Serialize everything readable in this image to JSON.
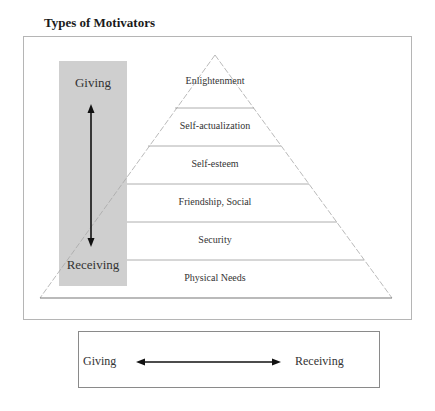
{
  "title": "Types of Motivators",
  "pyramid": {
    "levels": [
      {
        "label": "Enlightenment"
      },
      {
        "label": "Self-actualization"
      },
      {
        "label": "Self-esteem"
      },
      {
        "label": "Friendship, Social"
      },
      {
        "label": "Security"
      },
      {
        "label": "Physical Needs"
      }
    ]
  },
  "side_axis": {
    "top_label": "Giving",
    "bottom_label": "Receiving",
    "arrow": "double-vertical-arrow"
  },
  "bottom_scale": {
    "left_label": "Giving",
    "right_label": "Receiving",
    "arrow": "double-horizontal-arrow"
  },
  "colors": {
    "grey_box": "#cfcfcf",
    "lines": "#9a9a9a",
    "arrow": "#111111"
  }
}
